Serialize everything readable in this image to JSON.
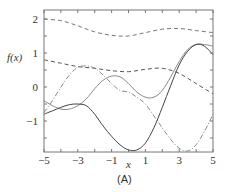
{
  "chart_data": {
    "type": "line",
    "title": "",
    "panel_label": "(A)",
    "xlabel": "x",
    "ylabel": "f(x)",
    "xlim": [
      -5,
      5
    ],
    "ylim": [
      -1.9,
      2.25
    ],
    "xticks": [
      -5,
      -3,
      -1,
      1,
      3,
      5
    ],
    "xtick_labels": [
      "−5",
      "−3",
      "−1",
      "1",
      "3",
      "5"
    ],
    "yticks": [
      -1,
      0,
      1,
      2
    ],
    "ytick_labels": [
      "−1",
      "0",
      "1",
      "2"
    ],
    "grid": false,
    "legend": null,
    "series": [
      {
        "name": "sample-dashed-upper",
        "style": "dashed",
        "color": "#777777",
        "x": [
          -5,
          -4,
          -3,
          -2,
          -1,
          0,
          1,
          2,
          3,
          4,
          5
        ],
        "y": [
          2.0,
          1.95,
          1.8,
          1.62,
          1.52,
          1.5,
          1.6,
          1.7,
          1.72,
          1.66,
          1.6
        ]
      },
      {
        "name": "sample-dashed-middle",
        "style": "dashed",
        "color": "#555555",
        "x": [
          -5,
          -4,
          -3,
          -2,
          -1,
          0,
          1,
          2,
          3,
          4,
          5
        ],
        "y": [
          0.8,
          0.7,
          0.6,
          0.55,
          0.48,
          0.45,
          0.52,
          0.55,
          0.4,
          0.1,
          -0.2
        ]
      },
      {
        "name": "sample-dash-dot",
        "style": "dashdot",
        "color": "#888888",
        "x": [
          -5,
          -4.5,
          -4,
          -3.5,
          -3,
          -2.5,
          -2,
          -1.5,
          -1,
          -0.5,
          0,
          0.5,
          1,
          1.5,
          2,
          2.5,
          3,
          3.5,
          4,
          4.5,
          5
        ],
        "y": [
          -0.75,
          -0.4,
          0.0,
          0.35,
          0.58,
          0.62,
          0.55,
          0.35,
          0.1,
          -0.1,
          -0.15,
          -0.3,
          -0.5,
          -0.85,
          -1.2,
          -1.55,
          -1.8,
          -1.88,
          -1.7,
          -1.3,
          -0.8
        ]
      },
      {
        "name": "sample-solid-light",
        "style": "solid",
        "color": "#888888",
        "x": [
          -5,
          -4.5,
          -4,
          -3.5,
          -3,
          -2.5,
          -2,
          -1.5,
          -1,
          -0.5,
          0,
          0.5,
          1,
          1.5,
          2,
          2.5,
          3,
          3.5,
          4,
          4.5,
          5
        ],
        "y": [
          -0.4,
          -0.55,
          -0.65,
          -0.65,
          -0.55,
          -0.35,
          -0.05,
          0.2,
          0.32,
          0.3,
          0.1,
          -0.15,
          -0.3,
          -0.3,
          -0.1,
          0.3,
          0.75,
          1.1,
          1.25,
          1.25,
          1.2
        ]
      },
      {
        "name": "sample-solid-dark",
        "style": "solid",
        "color": "#444444",
        "x": [
          -5,
          -4.5,
          -4,
          -3.5,
          -3,
          -2.5,
          -2,
          -1.5,
          -1,
          -0.5,
          0,
          0.5,
          1,
          1.5,
          2,
          2.5,
          3,
          3.5,
          4,
          4.5,
          5
        ],
        "y": [
          -0.8,
          -0.7,
          -0.6,
          -0.52,
          -0.5,
          -0.55,
          -0.8,
          -1.15,
          -1.45,
          -1.7,
          -1.85,
          -1.85,
          -1.65,
          -1.2,
          -0.6,
          0.05,
          0.65,
          1.05,
          1.25,
          1.2,
          0.95
        ]
      }
    ]
  }
}
